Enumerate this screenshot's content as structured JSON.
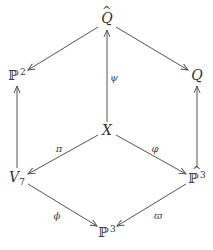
{
  "diagram": {
    "type": "commutative-diagram",
    "nodes": {
      "Q_hat": {
        "base": "Q",
        "accent": "hat",
        "label": "Q̂",
        "x": 107,
        "y": 18
      },
      "P2": {
        "base": "ℙ",
        "sup": "2",
        "label": "ℙ²",
        "x": 17,
        "y": 75
      },
      "Q": {
        "base": "Q",
        "label": "Q",
        "x": 197,
        "y": 75
      },
      "X": {
        "base": "X",
        "label": "X",
        "x": 107,
        "y": 130
      },
      "V7": {
        "base": "V",
        "sub": "7",
        "label": "V₇",
        "x": 17,
        "y": 178
      },
      "P3_hat": {
        "base": "ℙ",
        "sup": "3",
        "accent": "hat",
        "label": "ℙ̂³",
        "x": 197,
        "y": 178
      },
      "P3": {
        "base": "ℙ",
        "sup": "3",
        "label": "ℙ³",
        "x": 107,
        "y": 232
      }
    },
    "edges": [
      {
        "from": "Q_hat",
        "to": "P2",
        "label": ""
      },
      {
        "from": "Q_hat",
        "to": "Q",
        "label": ""
      },
      {
        "from": "X",
        "to": "Q_hat",
        "label": "ψ"
      },
      {
        "from": "V7",
        "to": "P2",
        "label": ""
      },
      {
        "from": "P3_hat",
        "to": "Q",
        "label": ""
      },
      {
        "from": "X",
        "to": "V7",
        "label": "π"
      },
      {
        "from": "X",
        "to": "P3_hat",
        "label": "φ"
      },
      {
        "from": "V7",
        "to": "P3",
        "label": "ϕ"
      },
      {
        "from": "P3_hat",
        "to": "P3",
        "label": "ϖ"
      }
    ],
    "colors": {
      "line": "#555555",
      "text": "#333333"
    }
  }
}
